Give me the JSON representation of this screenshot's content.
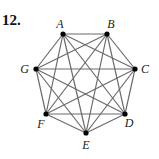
{
  "problem_number": "12.",
  "graph": {
    "type": "complete-graph",
    "vertices": [
      {
        "id": "A",
        "label": "A"
      },
      {
        "id": "B",
        "label": "B"
      },
      {
        "id": "C",
        "label": "C"
      },
      {
        "id": "D",
        "label": "D"
      },
      {
        "id": "E",
        "label": "E"
      },
      {
        "id": "F",
        "label": "F"
      },
      {
        "id": "G",
        "label": "G"
      }
    ],
    "edges": [
      [
        "A",
        "B"
      ],
      [
        "A",
        "C"
      ],
      [
        "A",
        "D"
      ],
      [
        "A",
        "E"
      ],
      [
        "A",
        "F"
      ],
      [
        "A",
        "G"
      ],
      [
        "B",
        "C"
      ],
      [
        "B",
        "D"
      ],
      [
        "B",
        "E"
      ],
      [
        "B",
        "F"
      ],
      [
        "B",
        "G"
      ],
      [
        "C",
        "D"
      ],
      [
        "C",
        "E"
      ],
      [
        "C",
        "F"
      ],
      [
        "C",
        "G"
      ],
      [
        "D",
        "E"
      ],
      [
        "D",
        "F"
      ],
      [
        "D",
        "G"
      ],
      [
        "E",
        "F"
      ],
      [
        "E",
        "G"
      ],
      [
        "F",
        "G"
      ]
    ]
  }
}
